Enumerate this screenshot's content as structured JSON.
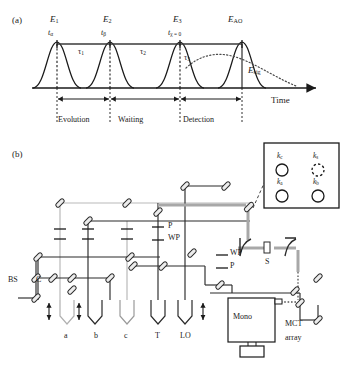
{
  "figure": {
    "panel_a_label": "(a)",
    "panel_b_label": "(b)"
  },
  "panel_a": {
    "type": "pulse-sequence-timing-diagram",
    "pulse_labels": [
      "E₁",
      "E₂",
      "E₃",
      "Eₐₒ"
    ],
    "pulses": [
      {
        "field": "E",
        "field_sub": "1",
        "time": "t",
        "time_sub": "α",
        "x": 57
      },
      {
        "field": "E",
        "field_sub": "2",
        "time": "t",
        "time_sub": "β",
        "x": 110
      },
      {
        "field": "E",
        "field_sub": "3",
        "time": "t",
        "time_sub": "χ = 0",
        "x": 180
      },
      {
        "field": "E",
        "field_sub": "AO",
        "time": "",
        "time_sub": "",
        "x": 242
      }
    ],
    "intervals": [
      {
        "label": "τ",
        "sub": "1",
        "from_x": 57,
        "to_x": 110
      },
      {
        "label": "τ",
        "sub": "2",
        "from_x": 110,
        "to_x": 180
      },
      {
        "label": "τ",
        "sub": "3",
        "from_x": 180,
        "to_x": 242
      }
    ],
    "signal_label": {
      "main": "E",
      "sub": "sig"
    },
    "axis_label": "Time",
    "periods": [
      {
        "label": "Evolution",
        "from_x": 57,
        "to_x": 110
      },
      {
        "label": "Waiting",
        "from_x": 110,
        "to_x": 180
      },
      {
        "label": "Detection",
        "from_x": 180,
        "to_x": 242
      }
    ]
  },
  "panel_b": {
    "type": "optical-setup-schematic",
    "components": [
      {
        "name": "beamsplitter",
        "label": "BS",
        "x": 8,
        "y": 281
      },
      {
        "name": "chopper",
        "label": "C",
        "x": 36,
        "y": 281
      },
      {
        "name": "polarizer-mid",
        "label": "P",
        "x": 163,
        "y": 224
      },
      {
        "name": "waveplate-mid",
        "label": "WP",
        "x": 163,
        "y": 238
      },
      {
        "name": "waveplate-right",
        "label": "WP",
        "x": 228,
        "y": 253
      },
      {
        "name": "polarizer-right",
        "label": "P",
        "x": 228,
        "y": 267
      },
      {
        "name": "sample",
        "label": "S",
        "x": 268,
        "y": 250
      },
      {
        "name": "monochromator",
        "label": "Mono",
        "x": 232,
        "y": 323
      },
      {
        "name": "detector",
        "label": "MCT array",
        "line1": "MCT",
        "line2": "array",
        "x": 286,
        "y": 331
      }
    ],
    "beam_labels": [
      {
        "label": "a",
        "x": 67
      },
      {
        "label": "b",
        "x": 97
      },
      {
        "label": "c",
        "x": 127
      },
      {
        "label": "T",
        "x": 158
      },
      {
        "label": "LO",
        "x": 185
      }
    ],
    "beam_labels_y": 332,
    "inset": {
      "name": "phase-matching-box-geometry",
      "spots": [
        {
          "label": "k",
          "sub": "c",
          "style": "solid",
          "col": 0,
          "row": 0
        },
        {
          "label": "k",
          "sub": "s",
          "style": "dashed",
          "col": 1,
          "row": 0
        },
        {
          "label": "k",
          "sub": "a",
          "style": "solid",
          "col": 0,
          "row": 1
        },
        {
          "label": "k",
          "sub": "b",
          "style": "solid",
          "col": 1,
          "row": 1
        }
      ]
    }
  },
  "colors": {
    "ink": "#1a1a1a",
    "line": "#2b2b2b",
    "beam_gray": "#9a9a9a",
    "beam_light": "#bdbdbd",
    "mirror_fill": "#e8e8e8"
  }
}
